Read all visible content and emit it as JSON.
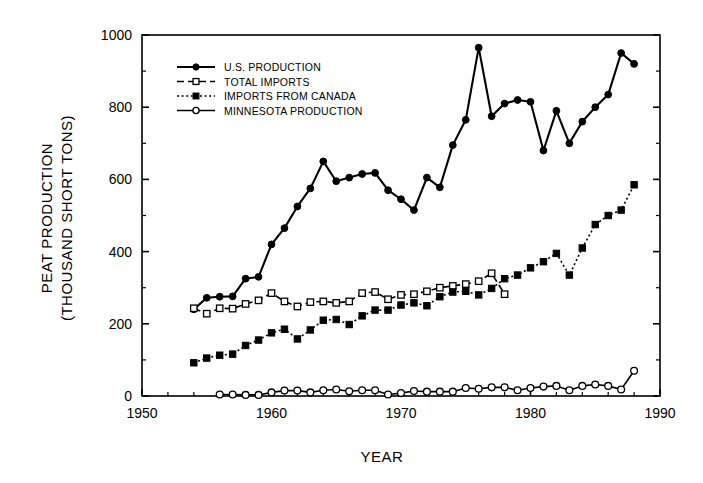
{
  "chart_data": {
    "type": "line",
    "title": "",
    "xlabel": "YEAR",
    "ylabel": "PEAT PRODUCTION (THOUSAND SHORT TONS)",
    "ylabel_line1": "PEAT PRODUCTION",
    "ylabel_line2": "(THOUSAND SHORT TONS)",
    "xlim": [
      1950,
      1990
    ],
    "ylim": [
      0,
      1000
    ],
    "xticks": [
      1950,
      1960,
      1970,
      1980,
      1990
    ],
    "xtick_labels": [
      "1950",
      "1960",
      "1970",
      "1980",
      "1990"
    ],
    "xminor_step": 2,
    "yticks": [
      0,
      200,
      400,
      600,
      800,
      1000
    ],
    "ytick_labels": [
      "0",
      "200",
      "400",
      "600",
      "800",
      "1000"
    ],
    "yminor_step": 100,
    "grid": false,
    "legend_position": "upper-left-inside",
    "series": [
      {
        "name": "U.S. PRODUCTION",
        "marker": "filled-circle",
        "line": "solid",
        "color": "#000000",
        "x": [
          1954,
          1955,
          1956,
          1957,
          1958,
          1959,
          1960,
          1961,
          1962,
          1963,
          1964,
          1965,
          1966,
          1967,
          1968,
          1969,
          1970,
          1971,
          1972,
          1973,
          1974,
          1975,
          1976,
          1977,
          1978,
          1979,
          1980,
          1981,
          1982,
          1983,
          1984,
          1985,
          1986,
          1987,
          1988
        ],
        "values": [
          240,
          272,
          275,
          276,
          325,
          330,
          420,
          465,
          525,
          575,
          650,
          595,
          605,
          615,
          618,
          570,
          545,
          515,
          605,
          578,
          695,
          765,
          965,
          775,
          810,
          820,
          815,
          680,
          790,
          700,
          760,
          800,
          835,
          950,
          920
        ]
      },
      {
        "name": "TOTAL IMPORTS",
        "marker": "open-square",
        "line": "dashed",
        "color": "#000000",
        "x": [
          1954,
          1955,
          1956,
          1957,
          1958,
          1959,
          1960,
          1961,
          1962,
          1963,
          1964,
          1965,
          1966,
          1967,
          1968,
          1969,
          1970,
          1971,
          1972,
          1973,
          1974,
          1975,
          1976,
          1977,
          1978
        ],
        "values": [
          243,
          228,
          243,
          242,
          255,
          265,
          285,
          262,
          248,
          260,
          262,
          258,
          262,
          285,
          288,
          268,
          280,
          282,
          290,
          300,
          305,
          310,
          318,
          340,
          282
        ]
      },
      {
        "name": "IMPORTS FROM CANADA",
        "marker": "filled-square",
        "line": "dotted",
        "color": "#000000",
        "x": [
          1954,
          1955,
          1956,
          1957,
          1958,
          1959,
          1960,
          1961,
          1962,
          1963,
          1964,
          1965,
          1966,
          1967,
          1968,
          1969,
          1970,
          1971,
          1972,
          1973,
          1974,
          1975,
          1976,
          1977,
          1978,
          1979,
          1980,
          1981,
          1982,
          1983,
          1984,
          1985,
          1986,
          1987,
          1988
        ],
        "values": [
          92,
          105,
          113,
          116,
          140,
          155,
          175,
          185,
          158,
          183,
          210,
          212,
          198,
          222,
          238,
          238,
          252,
          258,
          250,
          275,
          288,
          290,
          280,
          298,
          325,
          335,
          355,
          372,
          395,
          335,
          410,
          475,
          500,
          515,
          585
        ]
      },
      {
        "name": "MINNESOTA PRODUCTION",
        "marker": "open-circle",
        "line": "solid",
        "color": "#000000",
        "x": [
          1956,
          1957,
          1958,
          1959,
          1960,
          1961,
          1962,
          1963,
          1964,
          1965,
          1966,
          1967,
          1968,
          1969,
          1970,
          1971,
          1972,
          1973,
          1974,
          1975,
          1976,
          1977,
          1978,
          1979,
          1980,
          1981,
          1982,
          1983,
          1984,
          1985,
          1986,
          1987,
          1988
        ],
        "values": [
          4,
          4,
          3,
          3,
          10,
          15,
          15,
          10,
          16,
          18,
          13,
          16,
          16,
          4,
          8,
          14,
          12,
          12,
          12,
          22,
          20,
          24,
          24,
          16,
          22,
          26,
          28,
          16,
          28,
          32,
          28,
          18,
          70
        ]
      }
    ]
  },
  "legend": {
    "items": [
      {
        "label": "U.S. PRODUCTION",
        "marker": "filled-circle",
        "line": "solid"
      },
      {
        "label": "TOTAL IMPORTS",
        "marker": "open-square",
        "line": "dashed"
      },
      {
        "label": "IMPORTS FROM CANADA",
        "marker": "filled-square",
        "line": "dotted"
      },
      {
        "label": "MINNESOTA PRODUCTION",
        "marker": "open-circle",
        "line": "solid"
      }
    ]
  }
}
